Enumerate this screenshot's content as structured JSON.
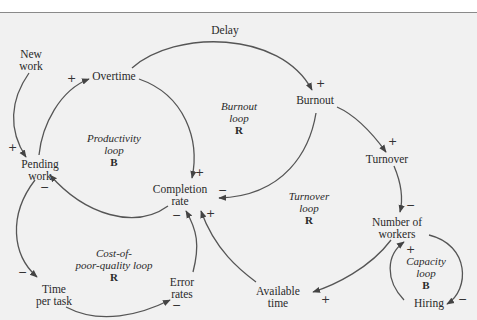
{
  "variables": {
    "new_work": [
      "New",
      "work"
    ],
    "overtime": [
      "Overtime"
    ],
    "delay": [
      "Delay"
    ],
    "burnout": [
      "Burnout"
    ],
    "turnover": [
      "Turnover"
    ],
    "pending_work": [
      "Pending",
      "work"
    ],
    "completion_rate": [
      "Completion",
      "rate"
    ],
    "number_of_workers": [
      "Number of",
      "workers"
    ],
    "time_per_task": [
      "Time",
      "per task"
    ],
    "error_rates": [
      "Error",
      "rates"
    ],
    "available_time": [
      "Available",
      "time"
    ],
    "hiring": [
      "Hiring"
    ]
  },
  "loops": {
    "productivity": {
      "name_lines": [
        "Productivity",
        "loop"
      ],
      "type": "B"
    },
    "burnout": {
      "name_lines": [
        "Burnout",
        "loop"
      ],
      "type": "R"
    },
    "turnover": {
      "name_lines": [
        "Turnover",
        "loop"
      ],
      "type": "R"
    },
    "cost_of_quality": {
      "name_lines": [
        "Cost-of-",
        "poor-quality loop"
      ],
      "type": "R"
    },
    "capacity": {
      "name_lines": [
        "Capacity",
        "loop"
      ],
      "type": "B"
    }
  },
  "links": [
    {
      "from": "New work",
      "to": "Pending work",
      "polarity": "+"
    },
    {
      "from": "Pending work",
      "to": "Overtime",
      "polarity": "+"
    },
    {
      "from": "Overtime",
      "to": "Burnout",
      "polarity": "+",
      "note": "Delay"
    },
    {
      "from": "Overtime",
      "to": "Completion rate",
      "polarity": "+"
    },
    {
      "from": "Burnout",
      "to": "Turnover",
      "polarity": "+"
    },
    {
      "from": "Burnout",
      "to": "Completion rate",
      "polarity": "−"
    },
    {
      "from": "Turnover",
      "to": "Number of workers",
      "polarity": "−"
    },
    {
      "from": "Completion rate",
      "to": "Pending work",
      "polarity": "−"
    },
    {
      "from": "Pending work",
      "to": "Time per task",
      "polarity": "−"
    },
    {
      "from": "Time per task",
      "to": "Error rates",
      "polarity": "−"
    },
    {
      "from": "Error rates",
      "to": "Completion rate",
      "polarity": "−"
    },
    {
      "from": "Available time",
      "to": "Completion rate",
      "polarity": "+"
    },
    {
      "from": "Number of workers",
      "to": "Available time",
      "polarity": "+"
    },
    {
      "from": "Number of workers",
      "to": "Hiring",
      "polarity": "−"
    },
    {
      "from": "Hiring",
      "to": "Number of workers",
      "polarity": "+"
    }
  ],
  "polarity_marks": {
    "p1": "+",
    "p2": "+",
    "p3": "+",
    "p4": "+",
    "p5": "+",
    "p6": "−",
    "p7": "−",
    "p8": "−",
    "p9": "−",
    "p10": "−",
    "p11": "−",
    "p12": "+",
    "p13": "+",
    "p14": "−",
    "p15": "+"
  }
}
